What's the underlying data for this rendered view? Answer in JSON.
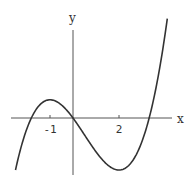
{
  "chart_data": {
    "type": "line",
    "title": "",
    "xlabel": "x",
    "ylabel": "y",
    "function": "x^3 - 1.5x^2 - 6x",
    "xlim": [
      -2.5,
      4.1
    ],
    "ylim": [
      -10.5,
      16.5
    ],
    "x_ticks": [
      {
        "value": -1,
        "label": "-1"
      },
      {
        "value": 2,
        "label": "2"
      }
    ],
    "grid": false,
    "legend": "none",
    "series": [
      {
        "name": "cubic curve",
        "color": "#333333",
        "key_points": [
          {
            "x": -2.5,
            "y": -10.0
          },
          {
            "x": -1.79,
            "y": 0
          },
          {
            "x": -1,
            "y": 3.5
          },
          {
            "x": 0,
            "y": 0
          },
          {
            "x": 2,
            "y": -10
          },
          {
            "x": 3.29,
            "y": 0
          },
          {
            "x": 4.1,
            "y": 18.3
          }
        ]
      }
    ]
  }
}
